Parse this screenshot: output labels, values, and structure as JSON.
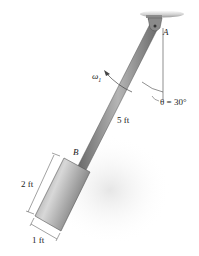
{
  "diagram": {
    "labels": {
      "pivot": "A",
      "joint": "B",
      "omega": "ω",
      "omega_sub": "1",
      "angle": "θ = 30°",
      "rod_length": "5 ft",
      "cyl_length": "2 ft",
      "cyl_width": "1 ft"
    },
    "colors": {
      "rod": "#8a8a8a",
      "rod_edge": "#555555",
      "cylinder": "#9a9a9a",
      "ceiling": "#c8c8c8",
      "text": "#222222"
    }
  }
}
